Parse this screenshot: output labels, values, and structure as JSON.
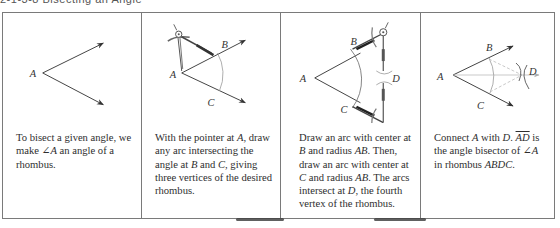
{
  "title": "2-1-3-8  Bisecting an Angle",
  "panels": [
    {
      "id": "step-1",
      "labels": {
        "A": "A"
      },
      "caption": {
        "t1": "To bisect a given angle, we make ",
        "angle": "∠A",
        "t2": " an angle of a rhombus."
      }
    },
    {
      "id": "step-2",
      "labels": {
        "A": "A",
        "B": "B",
        "C": "C"
      },
      "caption": {
        "t1": "With the pointer at ",
        "A": "A",
        "t2": ", draw any arc intersecting the angle at ",
        "B": "B",
        "t3": " and ",
        "C": "C",
        "t4": ", giving three vertices of the desired rhombus."
      }
    },
    {
      "id": "step-3",
      "labels": {
        "A": "A",
        "B": "B",
        "C": "C",
        "D": "D"
      },
      "caption": {
        "t1": "Draw an arc with center at ",
        "B": "B",
        "t2": " and radius ",
        "AB1": "AB",
        "t3": ". Then, draw an arc with center at ",
        "C": "C",
        "t4": " and radius ",
        "AB2": "AB",
        "t5": ". The arcs intersect at ",
        "D": "D",
        "t6": ", the fourth vertex of the rhombus."
      }
    },
    {
      "id": "step-4",
      "labels": {
        "A": "A",
        "B": "B",
        "C": "C",
        "D": "D"
      },
      "caption": {
        "t1": "Connect ",
        "A": "A",
        "t2": " with ",
        "D": "D",
        "t3": ". ",
        "ray": "AD",
        "t4": " is the angle bisector of ",
        "angle": "∠A",
        "t5": " in rhombus ",
        "rhombus": "ABDC",
        "t6": "."
      }
    }
  ],
  "colors": {
    "border": "#7a7a7a",
    "line": "#444444",
    "arc": "#8a8a8a",
    "dashed": "#b0b0b0",
    "text": "#2e2e2e"
  }
}
